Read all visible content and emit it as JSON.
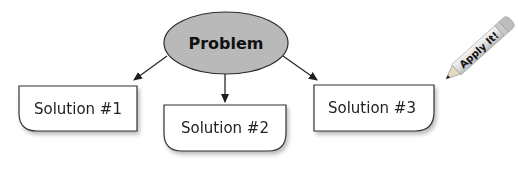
{
  "diagram": {
    "type": "problem-solution-map",
    "problem": {
      "label": "Problem",
      "fill": "#b9b9b9",
      "stroke": "#2a2a2a"
    },
    "solutions": [
      {
        "label": "Solution #1",
        "rounded_corner": "bottom-left"
      },
      {
        "label": "Solution #2",
        "rounded_corner": "bottom-left,bottom-right"
      },
      {
        "label": "Solution #3",
        "rounded_corner": "bottom-right"
      }
    ],
    "edges": [
      {
        "from": "Problem",
        "to": "Solution #1"
      },
      {
        "from": "Problem",
        "to": "Solution #2"
      },
      {
        "from": "Problem",
        "to": "Solution #3"
      }
    ],
    "badge": {
      "label": "Apply It!",
      "icon": "pencil-icon"
    },
    "colors": {
      "line": "#2a2a2a",
      "box_fill": "#ffffff",
      "shadow": "#d4d4d4"
    }
  }
}
